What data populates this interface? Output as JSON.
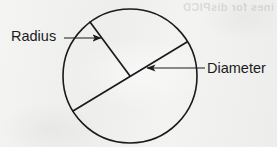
{
  "figure": {
    "background_color": "#f2f2f1",
    "ink_color": "#1b1b1b",
    "ghost_text": "ines for disPlCD",
    "circle": {
      "center_x": 130,
      "center_y": 76,
      "radius": 67,
      "stroke_width": 1.6
    },
    "diameter_segment": {
      "x1": 73,
      "y1": 111,
      "x2": 187,
      "y2": 42,
      "stroke_width": 1.7
    },
    "radius_segment": {
      "x1": 90,
      "y1": 22,
      "x2": 130,
      "y2": 76,
      "stroke_width": 1.7
    },
    "labels": [
      {
        "id": "radius",
        "text": "Radius",
        "x": 11,
        "y": 29,
        "leader": {
          "x1": 64,
          "y1": 38,
          "x2": 101,
          "y2": 38,
          "arrow": "right"
        }
      },
      {
        "id": "diameter",
        "text": "Diameter",
        "x": 207,
        "y": 61,
        "leader": {
          "x1": 205,
          "y1": 68,
          "x2": 147,
          "y2": 68,
          "arrow": "left"
        }
      }
    ]
  }
}
